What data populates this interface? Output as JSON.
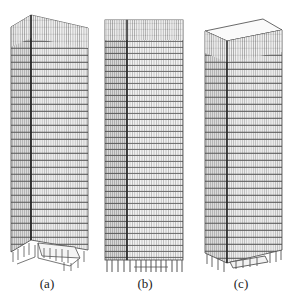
{
  "figure": {
    "panels": [
      {
        "id": "a",
        "label": "(a)",
        "description": "Tall building model, perspective view from corner, with cut-away podium/base frame at ground level"
      },
      {
        "id": "b",
        "label": "(b)",
        "description": "Tall building model, elevation view with column base"
      },
      {
        "id": "c",
        "label": "(c)",
        "description": "Tall building model, perspective view with flat roof and column base"
      }
    ],
    "colors": {
      "line": "#4a4a4a",
      "face_light": "#e6e6e6",
      "face_dark": "#cfcfcf",
      "background": "#ffffff"
    }
  }
}
